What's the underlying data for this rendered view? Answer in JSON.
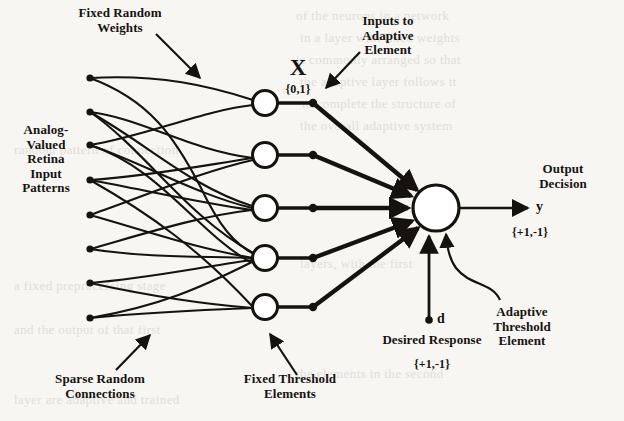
{
  "figure": {
    "background_color": "#f7f6f3",
    "ink_color": "#16130f"
  },
  "annotations": {
    "fixed_random_weights": "Fixed Random\nWeights",
    "analog_valued_retina_input_patterns": "Analog-\nValued\nRetina\nInput\nPatterns",
    "sparse_random_connections": "Sparse Random\nConnections",
    "fixed_threshold_elements": "Fixed Threshold\nElements",
    "inputs_to_adaptive_element": "Inputs to\nAdaptive\nElement",
    "adaptive_threshold_element": "Adaptive\nThreshold\nElement",
    "desired_response": "Desired Response",
    "output_decision": "Output\nDecision"
  },
  "symbols": {
    "x_vector": "X",
    "x_range": "{0,1}",
    "y_output": "y",
    "y_range": "{+1,-1}",
    "d_input": "d",
    "d_range": "{+1,-1}"
  },
  "network": {
    "input_dots_count": 8,
    "hidden_units_count": 5,
    "output_units_count": 1,
    "input_dots_y": [
      78,
      112,
      145,
      180,
      215,
      249,
      283,
      318
    ],
    "input_dots_x": 90,
    "hidden_nodes_y": [
      103,
      155,
      208,
      258,
      307
    ],
    "hidden_nodes_x": 265,
    "hidden_node_radius": 12,
    "junction_dots_x": 313,
    "output_node": {
      "x": 436,
      "y": 208,
      "r": 23
    },
    "connections": [
      [
        0,
        0
      ],
      [
        0,
        1
      ],
      [
        1,
        0
      ],
      [
        1,
        2
      ],
      [
        1,
        3
      ],
      [
        2,
        0
      ],
      [
        2,
        2
      ],
      [
        3,
        1
      ],
      [
        3,
        2
      ],
      [
        4,
        1
      ],
      [
        4,
        3
      ],
      [
        5,
        2
      ],
      [
        5,
        3
      ],
      [
        6,
        3
      ],
      [
        6,
        4
      ],
      [
        7,
        3
      ],
      [
        7,
        4
      ]
    ]
  }
}
